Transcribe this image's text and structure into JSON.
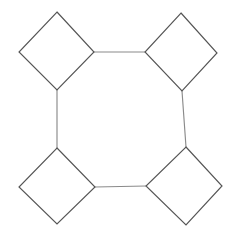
{
  "figure": {
    "background_color": "#ffffff",
    "canvas": {
      "width": 236,
      "height": 236
    },
    "square_stroke_color": "#555555",
    "connector_stroke_color": "#8a8a8a",
    "stroke_width": 1.15
  },
  "chart_data": {
    "type": "diagram",
    "shape_count": 4,
    "connector_count": 4,
    "squares": [
      {
        "name": "top-left-square",
        "orientation": "diamond",
        "vertices": [
          {
            "label": "top",
            "x": 57,
            "y": 12
          },
          {
            "label": "right",
            "x": 94,
            "y": 52
          },
          {
            "label": "bottom",
            "x": 57,
            "y": 90
          },
          {
            "label": "left",
            "x": 19,
            "y": 52
          }
        ]
      },
      {
        "name": "top-right-square",
        "orientation": "diamond",
        "vertices": [
          {
            "label": "top",
            "x": 181,
            "y": 13
          },
          {
            "label": "right",
            "x": 217,
            "y": 53
          },
          {
            "label": "bottom",
            "x": 182,
            "y": 91
          },
          {
            "label": "left",
            "x": 145,
            "y": 52
          }
        ]
      },
      {
        "name": "bottom-left-square",
        "orientation": "diamond",
        "vertices": [
          {
            "label": "top",
            "x": 57,
            "y": 148
          },
          {
            "label": "right",
            "x": 95,
            "y": 187
          },
          {
            "label": "bottom",
            "x": 57,
            "y": 224
          },
          {
            "label": "left",
            "x": 19,
            "y": 187
          }
        ]
      },
      {
        "name": "bottom-right-square",
        "orientation": "diamond",
        "vertices": [
          {
            "label": "top",
            "x": 186,
            "y": 147
          },
          {
            "label": "right",
            "x": 222,
            "y": 186
          },
          {
            "label": "bottom",
            "x": 186,
            "y": 225
          },
          {
            "label": "left",
            "x": 146,
            "y": 186
          }
        ]
      }
    ],
    "connectors": [
      {
        "name": "top-connector",
        "from": "top-left-square.right",
        "to": "top-right-square.left",
        "x1": 94,
        "y1": 52,
        "x2": 145,
        "y2": 52
      },
      {
        "name": "left-connector",
        "from": "top-left-square.bottom",
        "to": "bottom-left-square.top",
        "x1": 57,
        "y1": 90,
        "x2": 57,
        "y2": 148
      },
      {
        "name": "right-connector",
        "from": "top-right-square.bottom",
        "to": "bottom-right-square.top",
        "x1": 182,
        "y1": 91,
        "x2": 186,
        "y2": 147
      },
      {
        "name": "bottom-connector",
        "from": "bottom-left-square.right",
        "to": "bottom-right-square.left",
        "x1": 95,
        "y1": 187,
        "x2": 146,
        "y2": 186
      }
    ],
    "central_region": {
      "name": "central-octagon",
      "sides": 8,
      "vertices": [
        {
          "x": 94,
          "y": 52
        },
        {
          "x": 145,
          "y": 52
        },
        {
          "x": 182,
          "y": 91
        },
        {
          "x": 186,
          "y": 147
        },
        {
          "x": 146,
          "y": 186
        },
        {
          "x": 95,
          "y": 187
        },
        {
          "x": 57,
          "y": 148
        },
        {
          "x": 57,
          "y": 90
        }
      ]
    }
  }
}
